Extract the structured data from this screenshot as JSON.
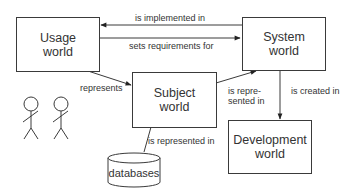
{
  "diagram": {
    "nodes": [
      {
        "id": "usage",
        "label": "Usage\nworld"
      },
      {
        "id": "system",
        "label": "System\nworld"
      },
      {
        "id": "subject",
        "label": "Subject\nworld"
      },
      {
        "id": "development",
        "label": "Development\nworld"
      },
      {
        "id": "databases",
        "label": "databases",
        "shape": "cylinder"
      },
      {
        "id": "users",
        "label": "",
        "shape": "stick-figures",
        "count": 2
      }
    ],
    "edges": [
      {
        "from": "system",
        "to": "usage",
        "label": "is implemented in"
      },
      {
        "from": "usage",
        "to": "system",
        "label": "sets requirements for"
      },
      {
        "from": "usage",
        "to": "subject",
        "label": "represents"
      },
      {
        "from": "subject",
        "to": "system",
        "label": "is repre-\nsented in"
      },
      {
        "from": "system",
        "to": "development",
        "label": "is created in"
      },
      {
        "from": "subject",
        "to": "databases",
        "label": "is represented in"
      }
    ]
  },
  "colors": {
    "line": "#3a3a3a",
    "text": "#333333",
    "background": "#ffffff"
  }
}
